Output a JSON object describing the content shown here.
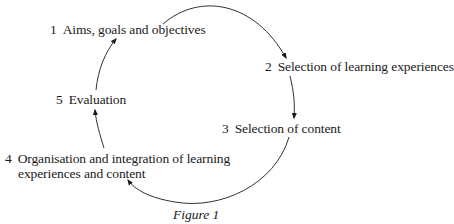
{
  "diagram": {
    "type": "cycle",
    "steps": [
      {
        "number": "1",
        "label": "Aims, goals and objectives"
      },
      {
        "number": "2",
        "label": "Selection of learning experiences"
      },
      {
        "number": "3",
        "label": "Selection of content"
      },
      {
        "number": "4",
        "label_line1": "Organisation and integration of learning",
        "label_line2": "experiences and content"
      },
      {
        "number": "5",
        "label": "Evaluation"
      }
    ],
    "caption": "Figure 1"
  }
}
